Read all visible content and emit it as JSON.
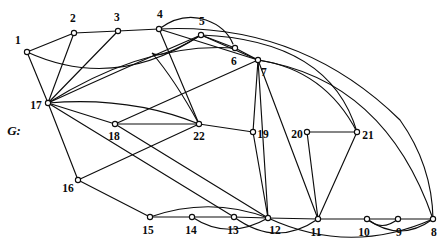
{
  "figure": {
    "name_label": "G:",
    "name_x": 14,
    "name_y": 131,
    "width": 445,
    "height": 250,
    "background": "#ffffff",
    "stroke_color": "#0d0d0d",
    "vertex_fill": "#ffffff"
  },
  "graph_data": {
    "type": "graph",
    "title": "G:",
    "vertex_count": 22,
    "edge_count": 44,
    "vertices": [
      {
        "id": "1",
        "x": 27,
        "y": 52,
        "label": "1",
        "label_x": 18,
        "label_y": 41
      },
      {
        "id": "2",
        "x": 74,
        "y": 33,
        "label": "2",
        "label_x": 73,
        "label_y": 19
      },
      {
        "id": "3",
        "x": 118,
        "y": 31,
        "label": "3",
        "label_x": 117,
        "label_y": 18
      },
      {
        "id": "4",
        "x": 159,
        "y": 29,
        "label": "4",
        "label_x": 160,
        "label_y": 15
      },
      {
        "id": "5",
        "x": 201,
        "y": 35,
        "label": "5",
        "label_x": 202,
        "label_y": 22
      },
      {
        "id": "6",
        "x": 235,
        "y": 48,
        "label": "6",
        "label_x": 234,
        "label_y": 62
      },
      {
        "id": "7",
        "x": 258,
        "y": 60,
        "label": "7",
        "label_x": 264,
        "label_y": 73
      },
      {
        "id": "8",
        "x": 433,
        "y": 219,
        "label": "8",
        "label_x": 434,
        "label_y": 233
      },
      {
        "id": "9",
        "x": 398,
        "y": 219,
        "label": "9",
        "label_x": 399,
        "label_y": 233
      },
      {
        "id": "10",
        "x": 367,
        "y": 219,
        "label": "10",
        "label_x": 364,
        "label_y": 233
      },
      {
        "id": "11",
        "x": 318,
        "y": 219,
        "label": "11",
        "label_x": 316,
        "label_y": 233
      },
      {
        "id": "12",
        "x": 268,
        "y": 218,
        "label": "12",
        "label_x": 275,
        "label_y": 231
      },
      {
        "id": "13",
        "x": 234,
        "y": 217,
        "label": "13",
        "label_x": 233,
        "label_y": 231
      },
      {
        "id": "14",
        "x": 192,
        "y": 217,
        "label": "14",
        "label_x": 191,
        "label_y": 231
      },
      {
        "id": "15",
        "x": 150,
        "y": 217,
        "label": "15",
        "label_x": 148,
        "label_y": 231
      },
      {
        "id": "16",
        "x": 78,
        "y": 180,
        "label": "16",
        "label_x": 68,
        "label_y": 189
      },
      {
        "id": "17",
        "x": 48,
        "y": 103,
        "label": "17",
        "label_x": 36,
        "label_y": 106
      },
      {
        "id": "18",
        "x": 115,
        "y": 124,
        "label": "18",
        "label_x": 114,
        "label_y": 137
      },
      {
        "id": "19",
        "x": 253,
        "y": 132,
        "label": "19",
        "label_x": 263,
        "label_y": 135
      },
      {
        "id": "20",
        "x": 307,
        "y": 132,
        "label": "20",
        "label_x": 297,
        "label_y": 135
      },
      {
        "id": "21",
        "x": 357,
        "y": 132,
        "label": "21",
        "label_x": 368,
        "label_y": 136
      },
      {
        "id": "22",
        "x": 199,
        "y": 124,
        "label": "22",
        "label_x": 199,
        "label_y": 137
      }
    ],
    "edges": [
      {
        "from": "1",
        "to": "2",
        "path": "M 27 52 L 74 33"
      },
      {
        "from": "1",
        "to": "17",
        "path": "M 27 52 L 48 103"
      },
      {
        "from": "1",
        "to": "5",
        "path": "M 27 52 Q 115 92 201 35"
      },
      {
        "from": "2",
        "to": "3",
        "path": "M 74 33 L 118 31"
      },
      {
        "from": "2",
        "to": "17",
        "path": "M 74 33 L 48 103"
      },
      {
        "from": "3",
        "to": "4",
        "path": "M 118 31 L 159 29"
      },
      {
        "from": "3",
        "to": "17",
        "path": "M 118 31 L 48 103"
      },
      {
        "from": "4",
        "to": "5",
        "path": "M 159 29 Q 182 12 206 20 Q 226 27 233 44"
      },
      {
        "from": "4",
        "to": "7",
        "path": "M 159 29 L 258 60"
      },
      {
        "from": "4",
        "to": "22",
        "path": "M 159 29 L 199 124"
      },
      {
        "from": "5",
        "to": "6",
        "path": "M 201 35 L 235 48"
      },
      {
        "from": "5",
        "to": "7",
        "path": "M 201 35 L 258 60"
      },
      {
        "from": "5",
        "to": "17",
        "path": "M 201 35 Q 120 70 48 103"
      },
      {
        "from": "5",
        "to": "22",
        "path": "M 201 35 Q 160 60 152 53 Q 175 80 199 124"
      },
      {
        "from": "6",
        "to": "7",
        "path": "M 235 48 L 258 60"
      },
      {
        "from": "6",
        "to": "17",
        "path": "M 235 48 Q 145 42 48 103"
      },
      {
        "from": "7",
        "to": "19",
        "path": "M 258 60 L 253 132"
      },
      {
        "from": "7",
        "to": "12",
        "path": "M 258 60 L 268 218"
      },
      {
        "from": "7",
        "to": "11",
        "path": "M 258 60 L 318 219"
      },
      {
        "from": "7",
        "to": "21",
        "path": "M 258 60 Q 325 70 357 132"
      },
      {
        "from": "7",
        "to": "8",
        "path": "M 258 60 Q 385 80 433 219"
      },
      {
        "from": "5",
        "to": "21",
        "path": "M 201 35 Q 330 40 357 132"
      },
      {
        "from": "4",
        "to": "8",
        "path": "M 159 29 Q 300 22 400 120 Q 432 165 433 219"
      },
      {
        "from": "17",
        "to": "18",
        "path": "M 48 103 L 115 124"
      },
      {
        "from": "17",
        "to": "16",
        "path": "M 48 103 L 78 180"
      },
      {
        "from": "17",
        "to": "22",
        "path": "M 48 103 Q 130 96 199 124"
      },
      {
        "from": "17",
        "to": "13",
        "path": "M 48 103 L 234 217"
      },
      {
        "from": "18",
        "to": "22",
        "path": "M 115 124 L 199 124"
      },
      {
        "from": "18",
        "to": "7",
        "path": "M 115 124 L 258 60"
      },
      {
        "from": "18",
        "to": "12",
        "path": "M 115 124 L 268 218"
      },
      {
        "from": "22",
        "to": "19",
        "path": "M 199 124 L 253 132"
      },
      {
        "from": "16",
        "to": "22",
        "path": "M 78 180 L 199 124"
      },
      {
        "from": "16",
        "to": "15",
        "path": "M 78 180 L 150 217"
      },
      {
        "from": "19",
        "to": "12",
        "path": "M 253 132 L 268 218"
      },
      {
        "from": "20",
        "to": "21",
        "path": "M 307 132 L 357 132"
      },
      {
        "from": "20",
        "to": "11",
        "path": "M 307 132 L 318 219"
      },
      {
        "from": "21",
        "to": "11",
        "path": "M 357 132 L 318 219"
      },
      {
        "from": "15",
        "to": "14",
        "path": "M 150 217 L 192 217"
      },
      {
        "from": "15",
        "to": "12",
        "path": "M 150 217 Q 210 196 268 218"
      },
      {
        "from": "14",
        "to": "13",
        "path": "M 192 217 L 234 217"
      },
      {
        "from": "14",
        "to": "12",
        "path": "M 192 217 Q 228 241 268 218"
      },
      {
        "from": "13",
        "to": "12",
        "path": "M 234 217 L 268 218"
      },
      {
        "from": "13",
        "to": "11",
        "path": "M 234 217 Q 276 248 318 219"
      },
      {
        "from": "12",
        "to": "11",
        "path": "M 268 218 L 318 219"
      },
      {
        "from": "12",
        "to": "8",
        "path": "M 268 218 Q 350 256 433 219"
      },
      {
        "from": "11",
        "to": "10",
        "path": "M 318 219 L 367 219"
      },
      {
        "from": "10",
        "to": "9",
        "path": "M 367 219 L 398 219"
      },
      {
        "from": "10",
        "to": "8",
        "path": "M 367 219 Q 400 243 433 219"
      },
      {
        "from": "9",
        "to": "8",
        "path": "M 398 219 L 433 219"
      },
      {
        "from": "9",
        "to": "10",
        "path": "M 398 219 Q 382 232 367 219"
      }
    ]
  }
}
